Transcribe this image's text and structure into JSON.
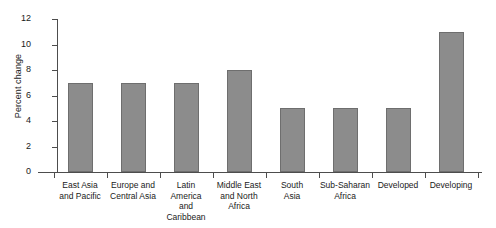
{
  "chart_data": {
    "type": "bar",
    "title": "",
    "subtitle": "",
    "xlabel": "",
    "ylabel": "Percent change",
    "categories": [
      "East Asia and Pacific",
      "Europe and Central Asia",
      "Latin America and Caribbean",
      "Middle East and North Africa",
      "South Asia",
      "Sub-Saharan Africa",
      "Developed",
      "Developing"
    ],
    "category_lines": [
      [
        "East Asia",
        "and Pacific"
      ],
      [
        "Europe and",
        "Central Asia"
      ],
      [
        "Latin",
        "America",
        "and",
        "Caribbean"
      ],
      [
        "Middle East",
        "and North",
        "Africa"
      ],
      [
        "South",
        "Asia"
      ],
      [
        "Sub-Saharan",
        "Africa"
      ],
      [
        "Developed"
      ],
      [
        "Developing"
      ]
    ],
    "values": [
      7,
      7,
      7,
      8,
      5,
      5,
      5,
      11
    ],
    "ylim": [
      0,
      12
    ],
    "ytick_values": [
      0,
      2,
      4,
      6,
      8,
      10,
      12
    ],
    "ytick_labels": [
      "0",
      "2",
      "4",
      "6",
      "8",
      "10",
      "12"
    ],
    "grid": false,
    "legend": false,
    "legend_position": "none",
    "bar_color": "#8c8c8c",
    "bar_border_color": "#6e6e6e",
    "axis_color": "#4d4d4d",
    "background_color": "#ffffff"
  }
}
